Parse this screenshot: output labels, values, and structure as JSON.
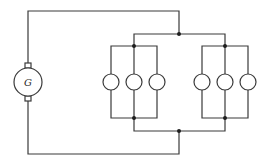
{
  "diagram": {
    "type": "electrical-circuit",
    "generator": {
      "label": "G",
      "cx": 28,
      "cy": 82,
      "r": 14
    },
    "colors": {
      "wire": "#3a3a3a",
      "junction": "#1e1e1e",
      "background": "#ffffff"
    },
    "lamp_banks": [
      {
        "name": "left-bank",
        "lamps_x": [
          111,
          134,
          157
        ],
        "lamp_cy": 82,
        "lamp_r": 8,
        "top_y": 46,
        "bottom_y": 118,
        "junction_x": 134
      },
      {
        "name": "right-bank",
        "lamps_x": [
          202,
          225,
          248
        ],
        "lamp_cy": 82,
        "lamp_r": 8,
        "top_y": 46,
        "bottom_y": 118,
        "junction_x": 225
      }
    ],
    "lamp_count": 6
  }
}
